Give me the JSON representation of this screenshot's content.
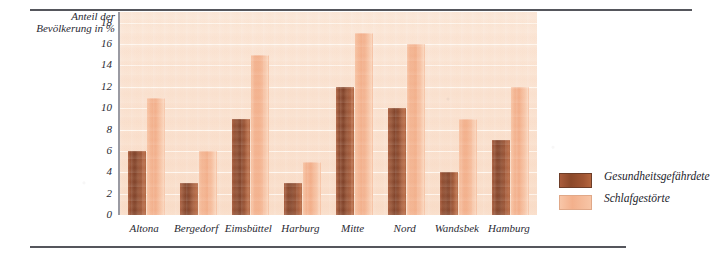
{
  "chart_data": {
    "type": "bar",
    "title": "",
    "xlabel": "",
    "ylabel": "Anteil der Bevölkerung in %",
    "ylabel_lines": [
      "Anteil der",
      "Bevölkerung in %"
    ],
    "ylim": [
      0,
      19
    ],
    "yticks": [
      18,
      16,
      14,
      12,
      10,
      8,
      6,
      4,
      2,
      0
    ],
    "grid": true,
    "legend_position": "right",
    "categories": [
      "Altona",
      "Bergedorf",
      "Eimsbüttel",
      "Harburg",
      "Mitte",
      "Nord",
      "Wandsbek",
      "Hamburg"
    ],
    "series": [
      {
        "name": "Gesundheitsgefährdete",
        "color": "#8d4a2e",
        "values": [
          6,
          3,
          9,
          3,
          12,
          10,
          4,
          7
        ]
      },
      {
        "name": "Schlafgestörte",
        "color": "#f3b390",
        "values": [
          11,
          6,
          15,
          5,
          17,
          16,
          9,
          12
        ]
      }
    ]
  },
  "legend": {
    "items": [
      {
        "label": "Gesundheitsgefährdete",
        "swatch": "dark"
      },
      {
        "label": "Schlafgestörte",
        "swatch": "light"
      }
    ]
  },
  "colors": {
    "bar_dark": "#8d4a2e",
    "bar_light": "#f3b390",
    "plot_background": "#fae2d1",
    "rule": "#55565c",
    "text": "#2a2a33"
  }
}
